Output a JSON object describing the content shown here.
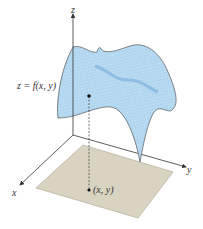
{
  "figure": {
    "axes": {
      "x_label": "x",
      "y_label": "y",
      "z_label": "z"
    },
    "surface_label": "z = f(x, y)",
    "domain_point_label": "(x, y)",
    "colors": {
      "surface_fill": "#bcdcf2",
      "surface_mesh": "#8fc2e6",
      "surface_ridge": "#6fa8d8",
      "surface_edge": "#555555",
      "domain_fill": "#d9d4c2",
      "domain_edge": "#b9b3a0",
      "axis": "#333333",
      "point": "#111111"
    }
  }
}
